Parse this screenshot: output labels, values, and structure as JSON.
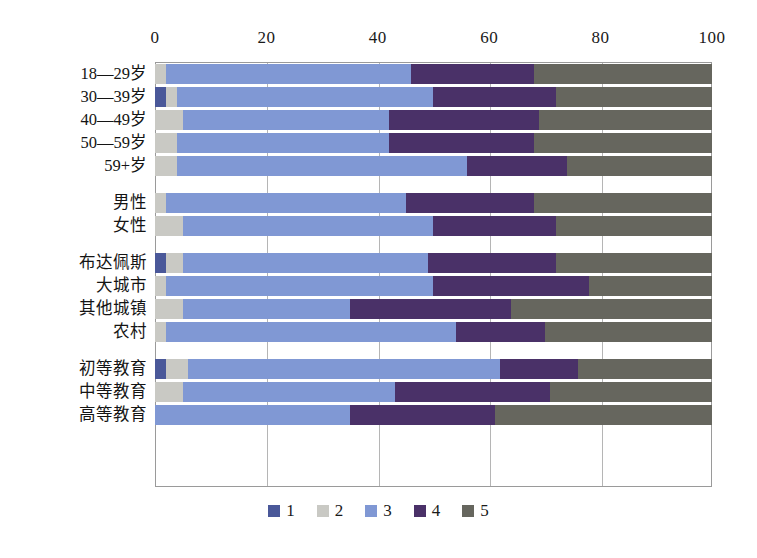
{
  "chart_data": {
    "type": "bar",
    "orientation": "horizontal",
    "stacked": true,
    "stack_mode": "percent",
    "title": "",
    "subtitle": "",
    "xlabel": "",
    "ylabel": "",
    "xlim": [
      0,
      100
    ],
    "xticks": [
      0,
      20,
      40,
      60,
      80,
      100
    ],
    "xtick_labels": [
      "0",
      "20",
      "40",
      "60",
      "80",
      "100"
    ],
    "grid": true,
    "grid_axis": "x",
    "legend_position": "bottom",
    "legend": [
      "1",
      "2",
      "3",
      "4",
      "5"
    ],
    "series": [
      {
        "name": "1",
        "color": "#4a5899",
        "values": [
          0,
          2,
          0,
          0,
          0,
          0,
          0,
          2,
          0,
          0,
          0,
          2,
          0,
          0
        ]
      },
      {
        "name": "2",
        "color": "#c9c9c4",
        "values": [
          2,
          2,
          5,
          4,
          4,
          2,
          5,
          3,
          2,
          5,
          2,
          4,
          5,
          0
        ]
      },
      {
        "name": "3",
        "color": "#8098d4",
        "values": [
          44,
          46,
          37,
          38,
          52,
          43,
          45,
          44,
          48,
          30,
          52,
          56,
          38,
          35
        ]
      },
      {
        "name": "4",
        "color": "#4a3168",
        "values": [
          22,
          22,
          27,
          26,
          18,
          23,
          22,
          23,
          28,
          29,
          16,
          14,
          28,
          26
        ]
      },
      {
        "name": "5",
        "color": "#66665e",
        "values": [
          32,
          28,
          31,
          32,
          26,
          32,
          28,
          28,
          22,
          36,
          30,
          24,
          29,
          39
        ]
      }
    ],
    "categories": [
      "18—29岁",
      "30—39岁",
      "40—49岁",
      "50—59岁",
      "59+岁",
      "男性",
      "女性",
      "布达佩斯",
      "大城市",
      "其他城镇",
      "农村",
      "初等教育",
      "中等教育",
      "高等教育"
    ],
    "groups": [
      {
        "name": "age",
        "categories": [
          "18—29岁",
          "30—39岁",
          "40—49岁",
          "50—59岁",
          "59+岁"
        ]
      },
      {
        "name": "gender",
        "categories": [
          "男性",
          "女性"
        ]
      },
      {
        "name": "settlement",
        "categories": [
          "布达佩斯",
          "大城市",
          "其他城镇",
          "农村"
        ]
      },
      {
        "name": "education",
        "categories": [
          "初等教育",
          "中等教育",
          "高等教育"
        ]
      }
    ]
  },
  "axis": {
    "ticks": [
      {
        "label": "0",
        "value": 0
      },
      {
        "label": "20",
        "value": 20
      },
      {
        "label": "40",
        "value": 40
      },
      {
        "label": "60",
        "value": 60
      },
      {
        "label": "80",
        "value": 80
      },
      {
        "label": "100",
        "value": 100
      }
    ]
  },
  "rows": [
    {
      "label": "18—29岁",
      "group": 0,
      "segments": [
        {
          "series": "2",
          "value": 2
        },
        {
          "series": "3",
          "value": 44
        },
        {
          "series": "4",
          "value": 22
        },
        {
          "series": "5",
          "value": 32
        }
      ]
    },
    {
      "label": "30—39岁",
      "group": 0,
      "segments": [
        {
          "series": "1",
          "value": 2
        },
        {
          "series": "2",
          "value": 2
        },
        {
          "series": "3",
          "value": 46
        },
        {
          "series": "4",
          "value": 22
        },
        {
          "series": "5",
          "value": 28
        }
      ]
    },
    {
      "label": "40—49岁",
      "group": 0,
      "segments": [
        {
          "series": "2",
          "value": 5
        },
        {
          "series": "3",
          "value": 37
        },
        {
          "series": "4",
          "value": 27
        },
        {
          "series": "5",
          "value": 31
        }
      ]
    },
    {
      "label": "50—59岁",
      "group": 0,
      "segments": [
        {
          "series": "2",
          "value": 4
        },
        {
          "series": "3",
          "value": 38
        },
        {
          "series": "4",
          "value": 26
        },
        {
          "series": "5",
          "value": 32
        }
      ]
    },
    {
      "label": "59+岁",
      "group": 0,
      "segments": [
        {
          "series": "2",
          "value": 4
        },
        {
          "series": "3",
          "value": 52
        },
        {
          "series": "4",
          "value": 18
        },
        {
          "series": "5",
          "value": 26
        }
      ]
    },
    {
      "label": "男性",
      "group": 1,
      "segments": [
        {
          "series": "2",
          "value": 2
        },
        {
          "series": "3",
          "value": 43
        },
        {
          "series": "4",
          "value": 23
        },
        {
          "series": "5",
          "value": 32
        }
      ]
    },
    {
      "label": "女性",
      "group": 1,
      "segments": [
        {
          "series": "2",
          "value": 5
        },
        {
          "series": "3",
          "value": 45
        },
        {
          "series": "4",
          "value": 22
        },
        {
          "series": "5",
          "value": 28
        }
      ]
    },
    {
      "label": "布达佩斯",
      "group": 2,
      "segments": [
        {
          "series": "1",
          "value": 2
        },
        {
          "series": "2",
          "value": 3
        },
        {
          "series": "3",
          "value": 44
        },
        {
          "series": "4",
          "value": 23
        },
        {
          "series": "5",
          "value": 28
        }
      ]
    },
    {
      "label": "大城市",
      "group": 2,
      "segments": [
        {
          "series": "2",
          "value": 2
        },
        {
          "series": "3",
          "value": 48
        },
        {
          "series": "4",
          "value": 28
        },
        {
          "series": "5",
          "value": 22
        }
      ]
    },
    {
      "label": "其他城镇",
      "group": 2,
      "segments": [
        {
          "series": "2",
          "value": 5
        },
        {
          "series": "3",
          "value": 30
        },
        {
          "series": "4",
          "value": 29
        },
        {
          "series": "5",
          "value": 36
        }
      ]
    },
    {
      "label": "农村",
      "group": 2,
      "segments": [
        {
          "series": "2",
          "value": 2
        },
        {
          "series": "3",
          "value": 52
        },
        {
          "series": "4",
          "value": 16
        },
        {
          "series": "5",
          "value": 30
        }
      ]
    },
    {
      "label": "初等教育",
      "group": 3,
      "segments": [
        {
          "series": "1",
          "value": 2
        },
        {
          "series": "2",
          "value": 4
        },
        {
          "series": "3",
          "value": 56
        },
        {
          "series": "4",
          "value": 14
        },
        {
          "series": "5",
          "value": 24
        }
      ]
    },
    {
      "label": "中等教育",
      "group": 3,
      "segments": [
        {
          "series": "2",
          "value": 5
        },
        {
          "series": "3",
          "value": 38
        },
        {
          "series": "4",
          "value": 28
        },
        {
          "series": "5",
          "value": 29
        }
      ]
    },
    {
      "label": "高等教育",
      "group": 3,
      "segments": [
        {
          "series": "3",
          "value": 35
        },
        {
          "series": "4",
          "value": 26
        },
        {
          "series": "5",
          "value": 39
        }
      ]
    }
  ],
  "legend": {
    "items": [
      {
        "label": "1",
        "color": "#4a5899"
      },
      {
        "label": "2",
        "color": "#c9c9c4"
      },
      {
        "label": "3",
        "color": "#8098d4"
      },
      {
        "label": "4",
        "color": "#4a3168"
      },
      {
        "label": "5",
        "color": "#66665e"
      }
    ]
  },
  "geometry": {
    "plot_left": 155,
    "plot_right": 712,
    "plot_top": 62,
    "plot_bottom": 487,
    "row_height": 20,
    "row_gap": 3,
    "group_gap": 14
  }
}
